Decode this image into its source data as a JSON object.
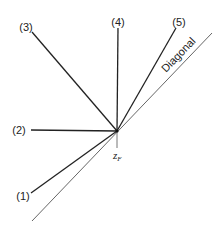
{
  "diagram": {
    "center": {
      "x": 117,
      "y": 131
    },
    "center_label": {
      "text": "z",
      "subscript": "F"
    },
    "diagonal": {
      "label": "Diagonal",
      "x1": 32,
      "y1": 221,
      "x2": 212,
      "y2": 33,
      "color": "#555555"
    },
    "rays": [
      {
        "id": "1",
        "label": "(1)",
        "x": 31,
        "y": 193,
        "label_x": 23,
        "label_y": 200
      },
      {
        "id": "2",
        "label": "(2)",
        "x": 31,
        "y": 130,
        "label_x": 19,
        "label_y": 134
      },
      {
        "id": "3",
        "label": "(3)",
        "x": 32,
        "y": 32,
        "label_x": 26,
        "label_y": 31
      },
      {
        "id": "4",
        "label": "(4)",
        "x": 118,
        "y": 28,
        "label_x": 118,
        "label_y": 26
      },
      {
        "id": "5",
        "label": "(5)",
        "x": 176,
        "y": 28,
        "label_x": 179,
        "label_y": 26
      }
    ],
    "ray_color": "#222222"
  }
}
